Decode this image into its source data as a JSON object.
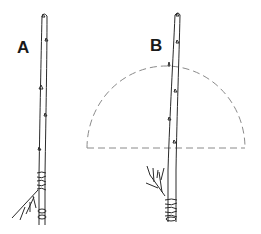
{
  "figure": {
    "labels": {
      "a": "A",
      "b": "B"
    },
    "colors": {
      "line": "#2a2a2a",
      "dashed": "#8a8a8a",
      "background": "#ffffff"
    }
  }
}
